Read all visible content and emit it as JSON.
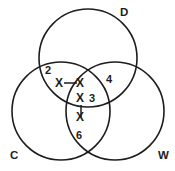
{
  "diagram": {
    "type": "venn-3-set",
    "background_color": "#ffffff",
    "stroke_color": "#1d1d1d",
    "width": 175,
    "height": 171,
    "sets": [
      {
        "id": "D",
        "label": "D",
        "label_x": 120,
        "label_y": 16,
        "cx": 88,
        "cy": 58,
        "r": 49
      },
      {
        "id": "C",
        "label": "C",
        "label_x": 10,
        "label_y": 159,
        "cx": 61,
        "cy": 111,
        "r": 49
      },
      {
        "id": "W",
        "label": "W",
        "label_x": 158,
        "label_y": 159,
        "cx": 115,
        "cy": 111,
        "r": 49
      }
    ],
    "region_counts": [
      {
        "id": "c-and-d",
        "value": "2",
        "x": 45,
        "y": 74
      },
      {
        "id": "d-and-w",
        "value": "4",
        "x": 106,
        "y": 83
      },
      {
        "id": "center-right",
        "value": "3",
        "x": 89,
        "y": 102
      },
      {
        "id": "c-and-w",
        "value": "6",
        "x": 76,
        "y": 139
      }
    ],
    "x_marks": [
      {
        "id": "x-outer-left",
        "value": "X",
        "x": 55,
        "y": 87
      },
      {
        "id": "x-upper-center",
        "value": "X",
        "x": 76,
        "y": 87
      },
      {
        "id": "x-middle-center",
        "value": "X",
        "x": 76,
        "y": 102
      },
      {
        "id": "x-lower-center",
        "value": "X",
        "x": 76,
        "y": 121
      }
    ],
    "connector_lines": [
      {
        "id": "horizontal-connector",
        "x1": 64,
        "y1": 83,
        "x2": 77,
        "y2": 83
      },
      {
        "id": "vertical-connector",
        "x1": 81,
        "y1": 105,
        "x2": 81,
        "y2": 117
      }
    ]
  }
}
